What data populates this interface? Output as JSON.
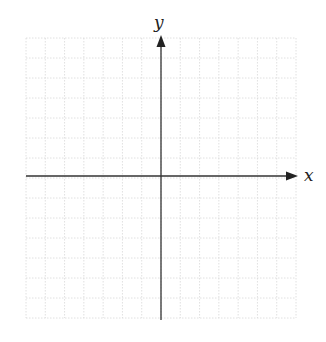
{
  "diagram": {
    "type": "cartesian-coordinate-plane",
    "x_axis_label": "x",
    "y_axis_label": "y",
    "grid": {
      "columns": 14,
      "rows": 14,
      "style": "dotted",
      "color": "#d8d8d8"
    },
    "axis_color": "#333333"
  }
}
